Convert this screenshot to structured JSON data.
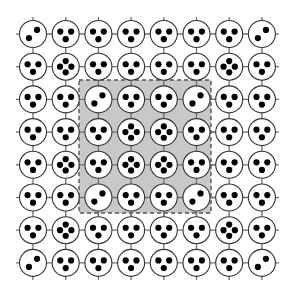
{
  "figure": {
    "title": "",
    "type": "lattice-graph-diagram",
    "canvas": {
      "width": 291,
      "height": 295,
      "background": "#ffffff"
    }
  },
  "style": {
    "node_fill": "#ffffff",
    "node_stroke": "#333333",
    "node_stroke_width": 1.1,
    "node_radius": 13.5,
    "dot_fill": "#000000",
    "dot_radius": 3.1,
    "edge_color": "#707070",
    "edge_width": 1.3,
    "highlight_fill": "#c8c8c8",
    "highlight_stroke": "#555555",
    "highlight_dash": "4,3",
    "highlight_stroke_width": 1.4
  },
  "lattice": {
    "rows": 8,
    "cols": 8,
    "origin_x": 33,
    "origin_y": 34,
    "spacing_x": 32.7,
    "spacing_y": 32.7,
    "stub_length": 17,
    "edges_note": "orthogonal nearest-neighbour bonds with open stubs at the boundary"
  },
  "highlight_region": {
    "label": "selected-sublattice",
    "x": 79,
    "y": 80,
    "width": 132,
    "height": 133,
    "row_range": [
      3,
      6
    ],
    "col_range": [
      3,
      6
    ]
  },
  "chart_data": {
    "type": "heatmap",
    "title": "",
    "xlabel": "",
    "ylabel": "",
    "categories": [
      "c1",
      "c2",
      "c3",
      "c4",
      "c5",
      "c6",
      "c7",
      "c8"
    ],
    "row_labels": [
      "r1",
      "r2",
      "r3",
      "r4",
      "r5",
      "r6",
      "r7",
      "r8"
    ],
    "value_meaning": "number of black dots (degree marker) inside each lattice node",
    "values": [
      [
        2,
        3,
        3,
        3,
        3,
        3,
        3,
        2
      ],
      [
        3,
        4,
        3,
        3,
        3,
        3,
        4,
        3
      ],
      [
        3,
        3,
        2,
        3,
        3,
        2,
        3,
        3
      ],
      [
        3,
        3,
        3,
        4,
        4,
        3,
        3,
        3
      ],
      [
        3,
        4,
        3,
        4,
        4,
        3,
        3,
        3
      ],
      [
        3,
        3,
        2,
        3,
        3,
        2,
        3,
        3
      ],
      [
        3,
        4,
        3,
        3,
        3,
        3,
        4,
        3
      ],
      [
        2,
        3,
        3,
        3,
        3,
        3,
        3,
        2
      ]
    ]
  }
}
